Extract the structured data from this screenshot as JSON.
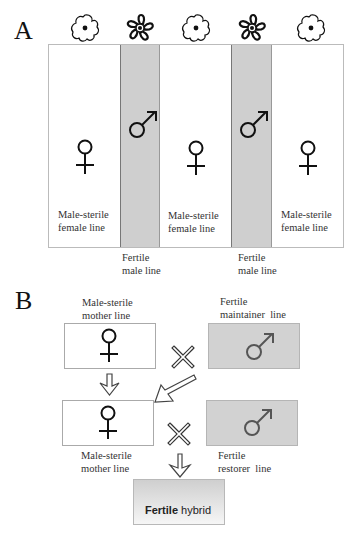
{
  "panel_a": {
    "letter": "A",
    "flowers": [
      {
        "type": "sterile-flower",
        "color": "#ffffff"
      },
      {
        "type": "fertile-flower",
        "color": "#111111"
      },
      {
        "type": "sterile-flower",
        "color": "#ffffff"
      },
      {
        "type": "fertile-flower",
        "color": "#111111"
      },
      {
        "type": "sterile-flower",
        "color": "#ffffff"
      }
    ],
    "strips": [
      {
        "kind": "female",
        "symbol": "♀",
        "label_line1": "Male-sterile",
        "label_line2": "female line"
      },
      {
        "kind": "male",
        "symbol": "♂",
        "label_line1": "Fertile",
        "label_line2": "male line"
      },
      {
        "kind": "female",
        "symbol": "♀",
        "label_line1": "Male-sterile",
        "label_line2": "female line"
      },
      {
        "kind": "male",
        "symbol": "♂",
        "label_line1": "Fertile",
        "label_line2": "male line"
      },
      {
        "kind": "female",
        "symbol": "♀",
        "label_line1": "Male-sterile",
        "label_line2": "female line"
      }
    ],
    "colors": {
      "female_strip": "#ffffff",
      "male_strip": "#cfcfcf"
    }
  },
  "panel_b": {
    "letter": "B",
    "mother_top": {
      "label_line1": "Male-sterile",
      "label_line2": "mother line",
      "symbol": "♀"
    },
    "maintainer": {
      "label_line1": "Fertile",
      "label_line2": "maintainer  line",
      "symbol": "♂"
    },
    "mother_bottom": {
      "label_line1": "Male-sterile",
      "label_line2": "mother line",
      "symbol": "♀"
    },
    "restorer": {
      "label_line1": "Fertile",
      "label_line2": "restorer  line",
      "symbol": "♂"
    },
    "cross_symbol": "×",
    "hybrid": {
      "bold_word": "Fertile",
      "rest": " hybrid"
    },
    "colors": {
      "grey_box": "#d2d2d2",
      "male_symbol": "#555555",
      "female_symbol": "#111111"
    }
  }
}
